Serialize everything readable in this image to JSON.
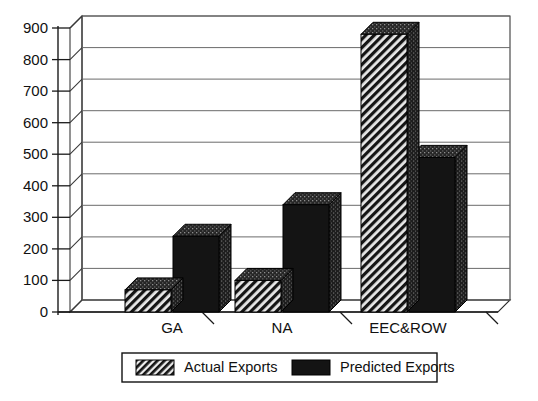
{
  "chart_data": {
    "type": "bar",
    "title": "",
    "subtitle": "",
    "xlabel": "",
    "ylabel": "",
    "categories": [
      "GA",
      "NA",
      "EEC&ROW"
    ],
    "series": [
      {
        "name": "Actual Exports",
        "values": [
          70,
          100,
          880
        ],
        "fill": "hatched",
        "color": "#1c1c1c"
      },
      {
        "name": "Predicted Exports",
        "values": [
          240,
          340,
          490
        ],
        "fill": "solid",
        "color": "#141414"
      }
    ],
    "ylim": [
      0,
      900
    ],
    "yticks": [
      0,
      100,
      200,
      300,
      400,
      500,
      600,
      700,
      800,
      900
    ],
    "ytick_labels": [
      "0",
      "100",
      "200",
      "300",
      "400",
      "500",
      "600",
      "700",
      "800",
      "900"
    ],
    "grid": true,
    "grid_axis": "y",
    "legend_position": "bottom",
    "style": "3d-perspective-bar",
    "background": "#ffffff"
  },
  "legend": {
    "entries": [
      {
        "label": "Actual Exports",
        "swatch": "hatched-swatch"
      },
      {
        "label": "Predicted Exports",
        "swatch": "solid-swatch"
      }
    ]
  },
  "colors": {
    "background": "#ffffff",
    "axis": "#1a1a1a",
    "grid": "#6b6b6b",
    "bar_actual": "#1c1c1c",
    "bar_predicted": "#141414",
    "bar_top_face": "#2e2e2e",
    "bar_side_face": "#3a3a3a",
    "text": "#111111"
  }
}
